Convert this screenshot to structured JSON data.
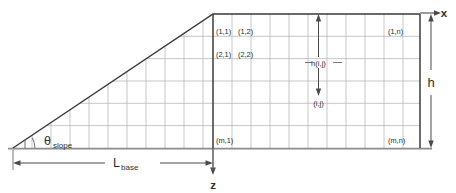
{
  "diagram": {
    "type": "engineering-schematic",
    "canvas": {
      "width": 456,
      "height": 193,
      "background": "#ffffff"
    },
    "colors": {
      "outline": "#3a3a3a",
      "grid": "#b9b9b9",
      "ground": "#8c8c8c",
      "axis": "#4a4a4a",
      "text": "#2e2e2e"
    },
    "geometry": {
      "apex_x": 13,
      "apex_y": 148,
      "crest_x": 213,
      "crest_y": 14,
      "right_x": 420,
      "base_y": 148,
      "grid_columns": 11,
      "grid_rows": 6,
      "col_width": 18.8,
      "row_height": 22.3
    },
    "axes": {
      "x_label": "x",
      "z_label": "z"
    },
    "dimensions": {
      "height_label": "h",
      "base_label_main": "L",
      "base_label_sub": "base",
      "angle_label_main": "θ",
      "angle_label_sub": "slope"
    },
    "cell_labels": [
      {
        "id": "cell-1-1",
        "text": "(1,1)",
        "x": 216,
        "y": 34
      },
      {
        "id": "cell-1-2",
        "text": "(1,2)",
        "x": 238,
        "y": 34
      },
      {
        "id": "cell-2-1",
        "text": "(2,1)",
        "x": 216,
        "y": 57
      },
      {
        "id": "cell-2-2",
        "text": "(2,2)",
        "x": 238,
        "y": 57
      },
      {
        "id": "cell-1-n",
        "text": "(1,n)",
        "x": 388,
        "y": 34
      },
      {
        "id": "cell-m-1",
        "text": "(m,1)",
        "x": 216,
        "y": 143
      },
      {
        "id": "cell-m-n",
        "text": "(m,n)",
        "x": 388,
        "y": 143
      }
    ],
    "annotations": {
      "cell_height_label": "h(i,j)",
      "cell_height_x": 320,
      "cell_height_y": 63,
      "cell_index_label": "(i,j)",
      "cell_index_x": 320,
      "cell_index_y": 103
    }
  }
}
